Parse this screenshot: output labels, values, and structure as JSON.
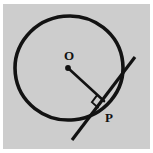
{
  "figure": {
    "background_color": "#cdcdcd",
    "border_color": "#ffffff",
    "ink_color": "#121212",
    "labels": {
      "center": "O",
      "tangent_point": "P",
      "right_angle": "right-angle-marker"
    },
    "elements": [
      "circle",
      "center-dot",
      "radius-segment",
      "tangent-line",
      "right-angle-marker",
      "label-O",
      "label-P"
    ]
  },
  "geometry": {
    "panel": {
      "width": 147,
      "height": 145
    },
    "circle": {
      "cx": 66,
      "cy": 64,
      "rx": 54,
      "ry": 52,
      "rotation": -6,
      "stroke_width": 3.6
    },
    "center_point": {
      "x": 65,
      "y": 64,
      "radius": 2.9
    },
    "tangent_point": {
      "x": 101,
      "y": 97
    },
    "radius_segment": {
      "x1": 65,
      "y1": 64,
      "x2": 101,
      "y2": 97,
      "stroke_width": 2.6
    },
    "tangent_line": {
      "x1": 69,
      "y1": 136,
      "x2": 132,
      "y2": 53,
      "stroke_width": 3.2
    },
    "right_angle_marker": {
      "size": 9,
      "stroke_width": 1.9,
      "corner_x": 101,
      "corner_y": 97
    },
    "label_O": {
      "x": 66,
      "y": 56,
      "font_size": 13
    },
    "label_P": {
      "x": 106,
      "y": 118,
      "font_size": 13
    }
  }
}
